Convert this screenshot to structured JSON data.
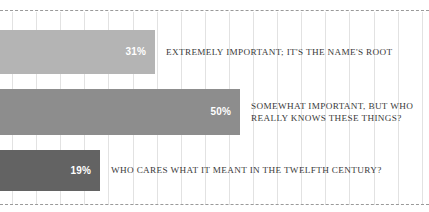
{
  "chart_data": {
    "type": "bar",
    "orientation": "horizontal",
    "title": "",
    "subtitle": "",
    "xlabel": "",
    "ylabel": "",
    "xlim": [
      0,
      100
    ],
    "grid": true,
    "grid_axis": "x",
    "legend": "none",
    "value_label_position": "inside-end",
    "categories": [
      "EXTREMELY IMPORTANT; IT'S THE NAME'S ROOT",
      "SOMEWHAT IMPORTANT, BUT WHO\nREALLY KNOWS THESE THINGS?",
      "WHO CARES WHAT IT MEANT IN THE TWELFTH CENTURY?"
    ],
    "values": [
      31,
      50,
      19
    ],
    "value_labels": [
      "31%",
      "50%",
      "19%"
    ],
    "colors": [
      "#b4b4b4",
      "#8d8d8d",
      "#636363"
    ]
  },
  "bars": [
    {
      "value_label": "31%",
      "category_label": "EXTREMELY IMPORTANT; IT'S THE NAME'S ROOT"
    },
    {
      "value_label": "50%",
      "category_label": "SOMEWHAT IMPORTANT, BUT WHO\nREALLY KNOWS THESE THINGS?"
    },
    {
      "value_label": "19%",
      "category_label": "WHO CARES WHAT IT MEANT IN THE TWELFTH CENTURY?"
    }
  ],
  "style": {
    "background": "#ffffff",
    "gridline_color": "#e2e2e2",
    "frame_rule_color": "#9a9a9a",
    "value_text_color": "#ffffff",
    "category_text_color": "#3a3a3a"
  }
}
